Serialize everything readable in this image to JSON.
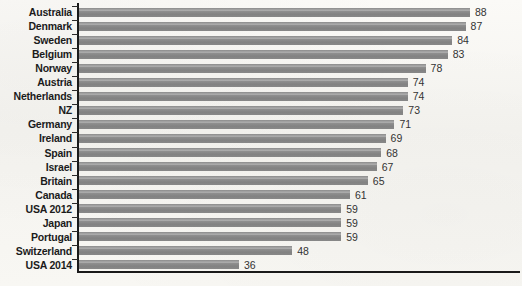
{
  "chart_data": {
    "type": "bar",
    "orientation": "horizontal",
    "title": "",
    "subtitle": "",
    "xlabel": "",
    "ylabel": "",
    "xlim": [
      0,
      100
    ],
    "grid": false,
    "legend": null,
    "bar_color": "#8d8d8d",
    "axis_color": "#1a1a1a",
    "background_color": "#f7f6f2",
    "categories": [
      "Australia",
      "Denmark",
      "Sweden",
      "Belgium",
      "Norway",
      "Austria",
      "Netherlands",
      "NZ",
      "Germany",
      "Ireland",
      "Spain",
      "Israel",
      "Britain",
      "Canada",
      "USA 2012",
      "Japan",
      "Portugal",
      "Switzerland",
      "USA 2014"
    ],
    "values": [
      88,
      87,
      84,
      83,
      78,
      74,
      74,
      73,
      71,
      69,
      68,
      67,
      65,
      61,
      59,
      59,
      59,
      48,
      36
    ],
    "value_labels": [
      "88",
      "87",
      "84",
      "83",
      "78",
      "74",
      "74",
      "73",
      "71",
      "69",
      "68",
      "67",
      "65",
      "61",
      "59",
      "59",
      "59",
      "48",
      "36"
    ]
  },
  "footnote": ""
}
